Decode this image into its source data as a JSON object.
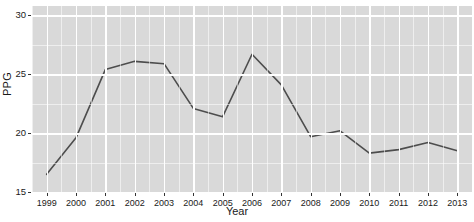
{
  "chart_data": {
    "type": "line",
    "title": "",
    "xlabel": "Year",
    "ylabel": "PPG",
    "x": [
      1999,
      2000,
      2001,
      2002,
      2003,
      2004,
      2005,
      2006,
      2007,
      2008,
      2009,
      2010,
      2011,
      2012,
      2013
    ],
    "values": [
      16.5,
      19.6,
      25.4,
      26.1,
      25.9,
      22.1,
      21.4,
      26.7,
      24.1,
      19.7,
      20.2,
      18.3,
      18.6,
      19.2,
      18.5
    ],
    "series": [
      {
        "name": "PPG",
        "values": [
          16.5,
          19.6,
          25.4,
          26.1,
          25.9,
          22.1,
          21.4,
          26.7,
          24.1,
          19.7,
          20.2,
          18.3,
          18.6,
          19.2,
          18.5
        ]
      }
    ],
    "xlim": [
      1998.5,
      2013.5
    ],
    "ylim": [
      15.0,
      30.8
    ],
    "yticks": [
      15,
      20,
      25,
      30
    ],
    "ytick_labels": [
      "15",
      "20",
      "25",
      "30"
    ],
    "xticks": [
      1999,
      2000,
      2001,
      2002,
      2003,
      2004,
      2005,
      2006,
      2007,
      2008,
      2009,
      2010,
      2011,
      2012,
      2013
    ],
    "xtick_labels": [
      "1999",
      "2000",
      "2001",
      "2002",
      "2003",
      "2004",
      "2005",
      "2006",
      "2007",
      "2008",
      "2009",
      "2010",
      "2011",
      "2012",
      "2013"
    ],
    "grid": true,
    "grid_color": "#ffffff",
    "panel_color": "#d9d9d9",
    "line_color": "#4d4d4d",
    "line_width": 1.6,
    "legend": "none",
    "legend_position": "none"
  },
  "axes": {
    "y_label": "PPG",
    "x_label": "Year"
  },
  "colors": {
    "panel": "#d9d9d9",
    "grid": "#ffffff",
    "line": "#4d4d4d",
    "text": "#1a1a1a",
    "background": "#ffffff"
  }
}
